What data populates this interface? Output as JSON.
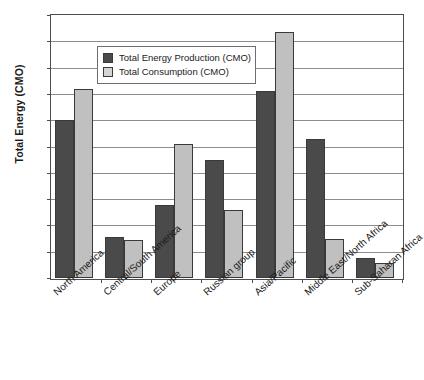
{
  "chart_data": {
    "type": "bar",
    "title": "",
    "xlabel": "",
    "ylabel": "Total Energy (CMO)",
    "ylim": [
      0,
      1
    ],
    "ytick_labels": [
      "1",
      "0.9",
      "0.8",
      "0.7",
      "0.6",
      "0.5",
      "0.4",
      "0.3",
      "0.2",
      "0.1",
      "0"
    ],
    "ytick_values": [
      1,
      0.9,
      0.8,
      0.7,
      0.6,
      0.5,
      0.4,
      0.3,
      0.2,
      0.1,
      0
    ],
    "grid": true,
    "legend_position": "upper-left-inside",
    "categories": [
      "North America",
      "Central/South America",
      "Europe",
      "Russian group",
      "Asia/Pacific",
      "Middle East/North Africa",
      "Sub-Saharan Africa"
    ],
    "series": [
      {
        "name": "Total Energy Production (CMO)",
        "color": "#4a4a4a",
        "values": [
          0.6,
          0.156,
          0.277,
          0.447,
          0.71,
          0.527,
          0.078
        ]
      },
      {
        "name": "Total Consumption (CMO)",
        "color": "#c0c0c0",
        "values": [
          0.718,
          0.146,
          0.508,
          0.26,
          0.935,
          0.148,
          0.058
        ]
      }
    ]
  },
  "legend": {
    "items": [
      {
        "label": "Total Energy Production (CMO)",
        "swatch": "legend-swatch-production"
      },
      {
        "label": "Total Consumption (CMO)",
        "swatch": "legend-swatch-consumption"
      }
    ]
  }
}
